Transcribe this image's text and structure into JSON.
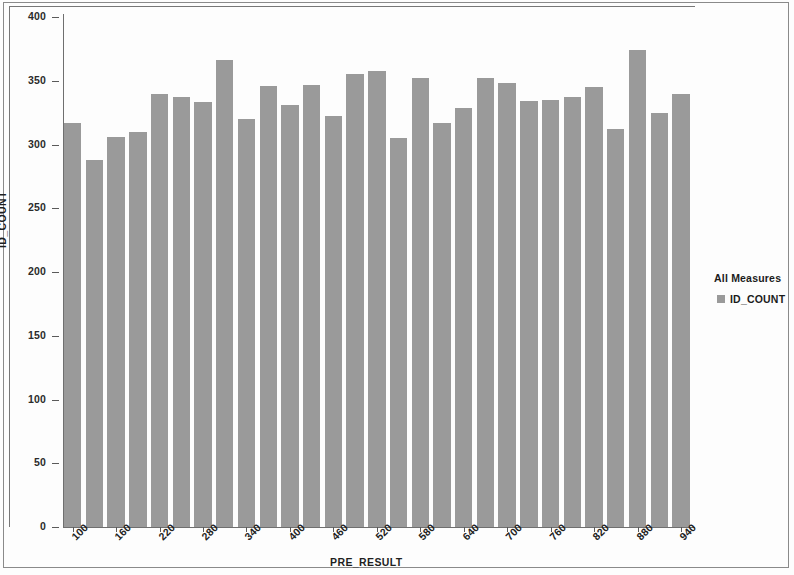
{
  "chart_data": {
    "type": "bar",
    "title": "",
    "xlabel": "PRE_RESULT",
    "ylabel": "ID_COUNT",
    "ylim": [
      0,
      400
    ],
    "ytick_values": [
      0,
      50,
      100,
      150,
      200,
      250,
      300,
      350,
      400
    ],
    "ytick_labels": [
      "0",
      "50",
      "100",
      "150",
      "200",
      "250",
      "300",
      "350",
      "400"
    ],
    "xtick_labels": [
      "100",
      "160",
      "220",
      "280",
      "340",
      "400",
      "460",
      "520",
      "580",
      "640",
      "700",
      "760",
      "820",
      "880",
      "940"
    ],
    "xtick_every_n_bars": 2,
    "grid": false,
    "bar_color": "#9a9a9a",
    "categories": [
      "100",
      "120",
      "140",
      "160",
      "180",
      "200",
      "220",
      "240",
      "260",
      "280",
      "300",
      "320",
      "340",
      "360",
      "380",
      "400",
      "420",
      "440",
      "460",
      "480",
      "500",
      "520",
      "540",
      "560",
      "580",
      "600",
      "620",
      "640",
      "660"
    ],
    "values": [
      317,
      288,
      306,
      310,
      340,
      337,
      333,
      366,
      320,
      346,
      331,
      347,
      322,
      355,
      358,
      305,
      352,
      317,
      329,
      352,
      348,
      334,
      335,
      337,
      345,
      312,
      374,
      325,
      340
    ],
    "series": [
      {
        "name": "ID_COUNT",
        "values": [
          317,
          288,
          306,
          310,
          340,
          337,
          333,
          366,
          320,
          346,
          331,
          347,
          322,
          355,
          358,
          305,
          352,
          317,
          329,
          352,
          348,
          334,
          335,
          337,
          345,
          312,
          374,
          325,
          340
        ]
      }
    ],
    "legend_position": "right"
  },
  "legend": {
    "title": "All Measures",
    "items": [
      {
        "label": "ID_COUNT",
        "color": "#9a9a9a"
      }
    ]
  }
}
